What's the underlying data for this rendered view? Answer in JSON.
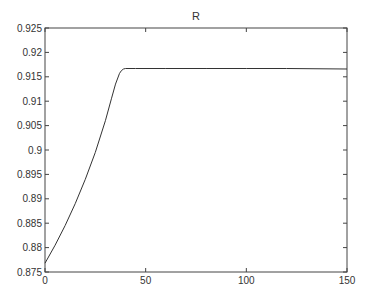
{
  "chart_data": {
    "type": "line",
    "title": "R",
    "xlabel": "",
    "ylabel": "",
    "xlim": [
      0,
      150
    ],
    "ylim": [
      0.875,
      0.925
    ],
    "xticks": [
      0,
      50,
      100,
      150
    ],
    "xtick_labels": [
      "0",
      "50",
      "100",
      "150"
    ],
    "yticks": [
      0.875,
      0.88,
      0.885,
      0.89,
      0.895,
      0.9,
      0.905,
      0.91,
      0.915,
      0.92,
      0.925
    ],
    "ytick_labels": [
      "0.875",
      "0.88",
      "0.885",
      "0.89",
      "0.895",
      "0.9",
      "0.905",
      "0.91",
      "0.915",
      "0.92",
      "0.925"
    ],
    "grid": false,
    "legend": null,
    "series": [
      {
        "name": "R",
        "color": "#333333",
        "x": [
          0,
          5,
          10,
          15,
          20,
          25,
          30,
          33,
          35,
          37,
          38,
          39,
          40,
          45,
          60,
          80,
          100,
          120,
          150
        ],
        "y": [
          0.8768,
          0.8805,
          0.8845,
          0.889,
          0.894,
          0.8995,
          0.906,
          0.9105,
          0.9135,
          0.9157,
          0.9163,
          0.9166,
          0.9167,
          0.9167,
          0.9167,
          0.9167,
          0.9167,
          0.9167,
          0.9166
        ]
      }
    ]
  }
}
